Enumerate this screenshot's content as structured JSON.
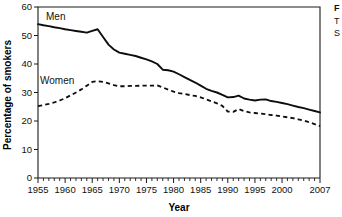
{
  "chart_data": {
    "type": "line",
    "title": "",
    "xlabel": "Year",
    "ylabel": "Percentage of smokers",
    "xlim": [
      1955,
      2007
    ],
    "ylim": [
      0,
      60
    ],
    "yticks": [
      0,
      10,
      20,
      30,
      40,
      50,
      60
    ],
    "ytick_labels": [
      "0",
      "10",
      "20",
      "30",
      "40",
      "50",
      "60"
    ],
    "xticks": [
      1955,
      1960,
      1965,
      1970,
      1975,
      1980,
      1985,
      1990,
      1995,
      2000,
      2007
    ],
    "xtick_labels": [
      "1955",
      "1960",
      "1965",
      "1970",
      "1975",
      "1980",
      "1985",
      "1990",
      "1995",
      "2000",
      "2007"
    ],
    "grid": false,
    "legend_position": "inline-annotation",
    "x": [
      1955,
      1956,
      1957,
      1958,
      1959,
      1960,
      1961,
      1962,
      1963,
      1964,
      1965,
      1966,
      1967,
      1968,
      1969,
      1970,
      1971,
      1972,
      1973,
      1974,
      1975,
      1976,
      1977,
      1978,
      1979,
      1980,
      1981,
      1982,
      1983,
      1984,
      1985,
      1986,
      1987,
      1988,
      1989,
      1990,
      1991,
      1992,
      1993,
      1994,
      1995,
      1996,
      1997,
      1998,
      1999,
      2000,
      2001,
      2002,
      2003,
      2004,
      2005,
      2006,
      2007
    ],
    "series": [
      {
        "name": "Men",
        "style": "solid",
        "color": "#0d0d0d",
        "values": [
          54.0,
          53.6,
          53.3,
          52.9,
          52.6,
          52.2,
          51.9,
          51.6,
          51.3,
          51.0,
          51.6,
          52.2,
          49.5,
          46.8,
          45.1,
          44.0,
          43.6,
          43.2,
          42.8,
          42.2,
          41.6,
          40.9,
          40.0,
          38.0,
          37.8,
          37.3,
          36.4,
          35.4,
          34.4,
          33.5,
          32.4,
          31.3,
          30.6,
          30.0,
          29.2,
          28.3,
          28.4,
          28.9,
          27.9,
          27.5,
          27.2,
          27.5,
          27.6,
          27.0,
          26.7,
          26.3,
          25.9,
          25.4,
          24.9,
          24.5,
          24.0,
          23.5,
          23.0
        ]
      },
      {
        "name": "Women",
        "style": "dashed",
        "color": "#0d0d0d",
        "values": [
          25.2,
          25.6,
          26.0,
          26.5,
          27.2,
          28.0,
          29.0,
          30.0,
          31.1,
          32.4,
          33.7,
          34.0,
          33.7,
          33.2,
          32.6,
          32.2,
          32.2,
          32.3,
          32.3,
          32.4,
          32.4,
          32.4,
          32.5,
          31.8,
          31.0,
          30.3,
          29.8,
          29.5,
          29.1,
          28.8,
          28.3,
          27.6,
          26.9,
          26.2,
          25.3,
          23.3,
          23.2,
          24.2,
          23.5,
          23.0,
          22.8,
          22.6,
          22.4,
          22.1,
          21.9,
          21.6,
          21.3,
          21.0,
          20.6,
          20.2,
          19.6,
          18.9,
          18.2
        ]
      }
    ],
    "annotations": [
      {
        "name": "men-label",
        "text": "Men"
      },
      {
        "name": "women-label",
        "text": "Women"
      }
    ]
  },
  "side_note": {
    "title": "F",
    "line1": "T",
    "line2": "S"
  }
}
